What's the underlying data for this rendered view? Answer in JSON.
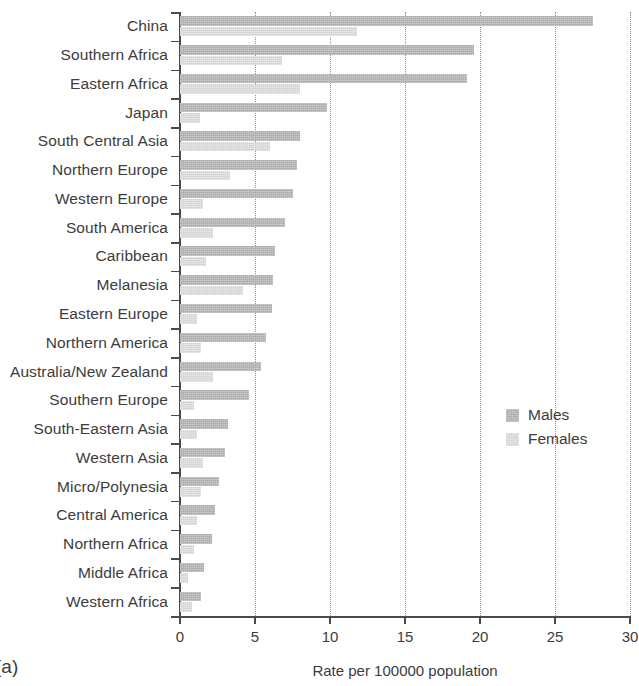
{
  "chart_data": {
    "type": "bar",
    "orientation": "horizontal",
    "title": "",
    "xlabel": "Rate per 100000 population",
    "ylabel": "",
    "xlim": [
      0,
      30
    ],
    "xticks": [
      0,
      5,
      10,
      15,
      20,
      25,
      30
    ],
    "xtick_labels": [
      "0",
      "5",
      "10",
      "15",
      "20",
      "25",
      "30"
    ],
    "grid": "vertical dotted gridlines at each x tick",
    "legend_position": "middle right, inside plot area",
    "categories": [
      "China",
      "Southern Africa",
      "Eastern Africa",
      "Japan",
      "South Central Asia",
      "Northern Europe",
      "Western Europe",
      "South America",
      "Caribbean",
      "Melanesia",
      "Eastern Europe",
      "Northern America",
      "Australia/New Zealand",
      "Southern Europe",
      "South-Eastern Asia",
      "Western Asia",
      "Micro/Polynesia",
      "Central America",
      "Northern Africa",
      "Middle Africa",
      "Western Africa"
    ],
    "series": [
      {
        "name": "Males",
        "color": "#a9a9a9",
        "values": [
          27.5,
          19.6,
          19.1,
          9.8,
          8.0,
          7.8,
          7.5,
          7.0,
          6.3,
          6.2,
          6.1,
          5.7,
          5.4,
          4.6,
          3.2,
          3.0,
          2.6,
          2.3,
          2.1,
          1.6,
          1.4
        ]
      },
      {
        "name": "Females",
        "color": "#d2d2d2",
        "values": [
          11.8,
          6.8,
          8.0,
          1.3,
          6.0,
          3.3,
          1.5,
          2.2,
          1.7,
          4.2,
          1.1,
          1.4,
          2.2,
          0.9,
          1.1,
          1.5,
          1.4,
          1.1,
          0.9,
          0.5,
          0.8
        ]
      }
    ]
  },
  "legend": {
    "items": [
      {
        "label": "Males",
        "color": "#a9a9a9"
      },
      {
        "label": "Females",
        "color": "#d2d2d2"
      }
    ]
  },
  "axis": {
    "x_title": "Rate per 100000 population"
  },
  "caption": {
    "panel_label": "(a)"
  }
}
